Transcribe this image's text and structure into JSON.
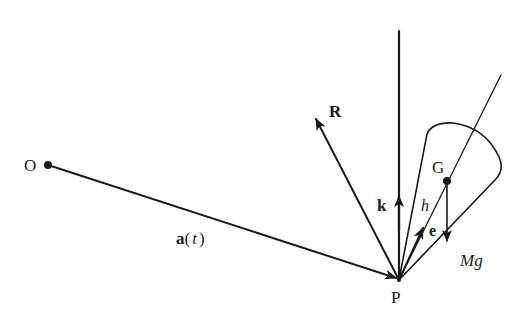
{
  "diagram": {
    "title": "",
    "points": {
      "O": {
        "label": "O"
      },
      "P": {
        "label": "P"
      },
      "G": {
        "label": "G"
      }
    },
    "vectors": {
      "position": {
        "label_bold": "a",
        "label_rest": "(",
        "label_var": "t",
        "label_close": ")"
      },
      "reaction": {
        "label": "R"
      },
      "vertical_unit": {
        "label": "k"
      },
      "axis_unit": {
        "label": "e"
      },
      "weight": {
        "label": "Mg"
      }
    },
    "distances": {
      "h": {
        "label": "h"
      }
    },
    "colors": {
      "ink": "#1a1a1a",
      "background": "#ffffff"
    }
  }
}
